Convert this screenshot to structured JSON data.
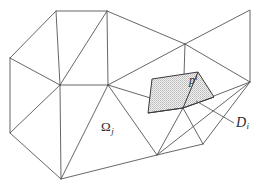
{
  "figure": {
    "type": "triangular-mesh-diagram",
    "width": 262,
    "height": 187,
    "background_color": "#ffffff",
    "edge_color": "#4a4a50",
    "shade_color": "#d8d8d8",
    "labels": {
      "omega": {
        "base": "Ω",
        "subscript": "j",
        "x": 101,
        "y": 120
      },
      "patch": {
        "base": "p",
        "superscript": "i",
        "x": 189,
        "y": 74
      },
      "domain": {
        "base": "D",
        "subscript": "i",
        "x": 236,
        "y": 116
      }
    },
    "mesh": {
      "outer_boundary": "10,58 56,11 107,11 185,44 250,10 250,82 157,155 61,179 10,133",
      "vertices": [
        {
          "name": "v-left-top",
          "x": 10,
          "y": 58
        },
        {
          "name": "v-top-left",
          "x": 56,
          "y": 11
        },
        {
          "name": "v-top-mid",
          "x": 107,
          "y": 11
        },
        {
          "name": "v-top-right",
          "x": 250,
          "y": 10
        },
        {
          "name": "v-mid-upper",
          "x": 185,
          "y": 44
        },
        {
          "name": "v-right",
          "x": 250,
          "y": 82
        },
        {
          "name": "v-center",
          "x": 108,
          "y": 85
        },
        {
          "name": "v-left-mid",
          "x": 60,
          "y": 85
        },
        {
          "name": "v-left-bottom",
          "x": 10,
          "y": 133
        },
        {
          "name": "v-bottom-left",
          "x": 61,
          "y": 179
        },
        {
          "name": "v-bottom-mid",
          "x": 157,
          "y": 155
        },
        {
          "name": "v-patch-center",
          "x": 183,
          "y": 108
        }
      ],
      "edges": [
        "10,58 56,11",
        "56,11 107,11",
        "107,11 185,44",
        "185,44 250,10",
        "250,10 250,82",
        "250,82 157,155",
        "157,155 61,179",
        "61,179 10,133",
        "10,133 10,58",
        "10,58 60,85",
        "56,11 60,85",
        "107,11 60,85",
        "107,11 108,85",
        "107,11 185,44",
        "60,85 108,85",
        "60,85 10,133",
        "60,85 61,179",
        "108,85 61,179",
        "108,85 157,155",
        "108,85 183,108",
        "108,85 185,44",
        "185,44 250,82",
        "185,44 183,108",
        "250,10 250,82",
        "183,108 250,82",
        "183,108 157,155",
        "183,108 203,144",
        "157,155 203,144",
        "203,144 250,82"
      ],
      "shaded_polygon": "152,79 198,72 214,97 183,108 148,113",
      "patch_edges": [
        "148,113 183,108",
        "183,108 198,72",
        "183,108 214,97",
        "183,108 203,144",
        "183,108 157,155"
      ]
    },
    "leader": {
      "name": "d-leader-line",
      "path": "234,123 196,101"
    }
  }
}
